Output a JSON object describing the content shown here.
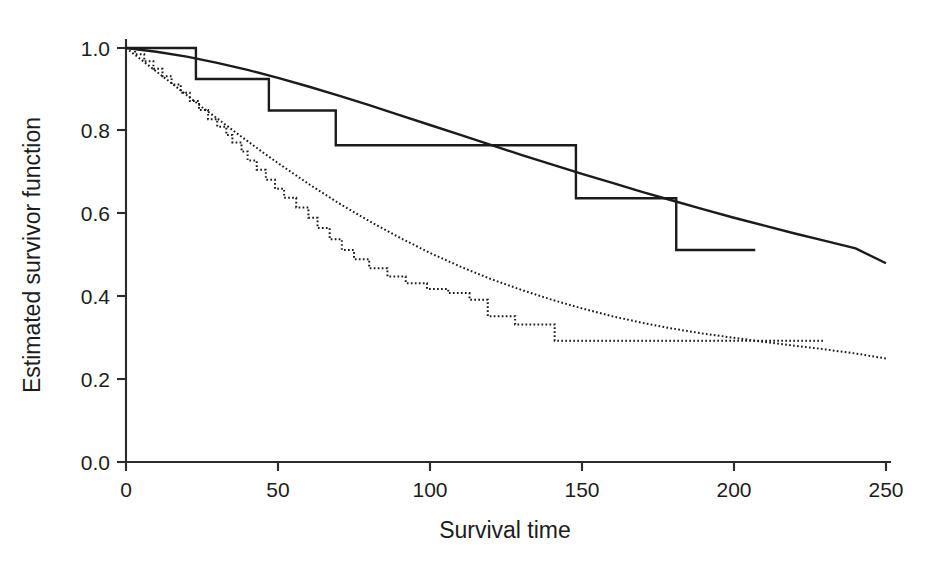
{
  "chart_data": {
    "type": "line",
    "title": "",
    "xlabel": "Survival time",
    "ylabel": "Estimated survivor function",
    "xlim": [
      0,
      250
    ],
    "ylim": [
      0.0,
      1.0
    ],
    "xticks": [
      0,
      50,
      100,
      150,
      200,
      250
    ],
    "xtick_labels": [
      "0",
      "50",
      "100",
      "150",
      "200",
      "250"
    ],
    "yticks": [
      0.0,
      0.2,
      0.4,
      0.6,
      0.8,
      1.0
    ],
    "ytick_labels": [
      "0.0",
      "0.2",
      "0.4",
      "0.6",
      "0.8",
      "1.0"
    ],
    "grid": false,
    "legend": null,
    "series": [
      {
        "name": "Group 1 Kaplan-Meier estimate",
        "style": "solid-step",
        "description": "Solid step function, upper curve",
        "x": [
          0,
          23,
          23,
          47,
          47,
          69,
          69,
          148,
          148,
          181,
          181,
          207
        ],
        "y": [
          1.0,
          1.0,
          0.925,
          0.925,
          0.849,
          0.849,
          0.765,
          0.765,
          0.637,
          0.637,
          0.512,
          0.512
        ]
      },
      {
        "name": "Group 1 fitted parametric survivor function",
        "style": "solid-smooth",
        "description": "Solid smooth fitted curve, upper curve",
        "x": [
          0,
          10,
          20,
          30,
          40,
          50,
          60,
          70,
          80,
          90,
          100,
          110,
          120,
          130,
          140,
          150,
          160,
          170,
          180,
          190,
          200,
          210,
          220,
          230,
          240,
          250
        ],
        "y": [
          1.0,
          0.991,
          0.979,
          0.964,
          0.947,
          0.928,
          0.907,
          0.885,
          0.862,
          0.838,
          0.814,
          0.79,
          0.766,
          0.742,
          0.719,
          0.696,
          0.674,
          0.652,
          0.631,
          0.61,
          0.59,
          0.571,
          0.552,
          0.534,
          0.516,
          0.48
        ]
      },
      {
        "name": "Group 2 Kaplan-Meier estimate",
        "style": "dotted-step",
        "description": "Dotted step function, lower curve",
        "x": [
          0,
          3,
          3,
          6,
          6,
          9,
          9,
          12,
          12,
          15,
          15,
          18,
          18,
          21,
          21,
          24,
          24,
          27,
          27,
          30,
          30,
          33,
          33,
          35,
          35,
          38,
          38,
          40,
          40,
          43,
          43,
          46,
          46,
          49,
          49,
          52,
          52,
          56,
          56,
          60,
          60,
          63,
          63,
          67,
          67,
          71,
          71,
          75,
          75,
          80,
          80,
          86,
          86,
          92,
          92,
          99,
          99,
          106,
          106,
          113,
          113,
          119,
          119,
          128,
          128,
          141,
          141,
          230
        ],
        "y": [
          1.0,
          1.0,
          0.985,
          0.985,
          0.968,
          0.968,
          0.95,
          0.95,
          0.932,
          0.932,
          0.912,
          0.912,
          0.892,
          0.892,
          0.872,
          0.872,
          0.85,
          0.85,
          0.828,
          0.828,
          0.81,
          0.81,
          0.79,
          0.79,
          0.772,
          0.772,
          0.75,
          0.75,
          0.728,
          0.728,
          0.706,
          0.706,
          0.682,
          0.682,
          0.66,
          0.66,
          0.638,
          0.638,
          0.615,
          0.615,
          0.59,
          0.59,
          0.565,
          0.565,
          0.538,
          0.538,
          0.512,
          0.512,
          0.49,
          0.49,
          0.468,
          0.468,
          0.448,
          0.448,
          0.432,
          0.432,
          0.418,
          0.418,
          0.408,
          0.408,
          0.392,
          0.392,
          0.352,
          0.352,
          0.332,
          0.332,
          0.293,
          0.293
        ]
      },
      {
        "name": "Group 2 fitted parametric survivor function",
        "style": "dotted-smooth",
        "description": "Dotted smooth fitted curve, lower curve",
        "x": [
          0,
          5,
          10,
          15,
          20,
          25,
          30,
          35,
          40,
          45,
          50,
          60,
          70,
          80,
          90,
          100,
          110,
          120,
          130,
          140,
          150,
          160,
          170,
          180,
          190,
          200,
          210,
          220,
          230,
          240,
          250
        ],
        "y": [
          1.0,
          0.972,
          0.943,
          0.915,
          0.886,
          0.857,
          0.83,
          0.802,
          0.775,
          0.748,
          0.722,
          0.672,
          0.625,
          0.582,
          0.542,
          0.505,
          0.472,
          0.442,
          0.416,
          0.392,
          0.371,
          0.352,
          0.336,
          0.322,
          0.31,
          0.3,
          0.29,
          0.281,
          0.272,
          0.262,
          0.25
        ]
      }
    ]
  },
  "axes": {
    "x_label": "Survival time",
    "y_label": "Estimated survivor function",
    "x_tick_labels": [
      "0",
      "50",
      "100",
      "150",
      "200",
      "250"
    ],
    "y_tick_labels": [
      "1.0",
      "0.8",
      "0.6",
      "0.4",
      "0.2",
      "0.0"
    ]
  },
  "colors": {
    "axis": "#2b2b2b",
    "curve": "#1b1b1b",
    "background": "#ffffff"
  }
}
